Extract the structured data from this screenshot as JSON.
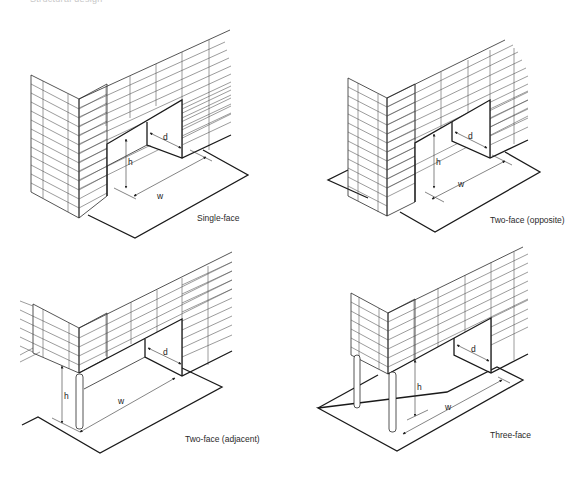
{
  "header": {
    "cut_off_text": "Structural design"
  },
  "panels": [
    {
      "id": "single-face",
      "caption": "Single-face",
      "dims": {
        "h": "h",
        "w": "w",
        "d": "d"
      }
    },
    {
      "id": "two-face-opposite",
      "caption": "Two-face (opposite)",
      "dims": {
        "h": "h",
        "w": "w",
        "d": "d"
      }
    },
    {
      "id": "two-face-adjacent",
      "caption": "Two-face (adjacent)",
      "dims": {
        "h": "h",
        "w": "w",
        "d": "d"
      }
    },
    {
      "id": "three-face",
      "caption": "Three-face",
      "dims": {
        "h": "h",
        "w": "w",
        "d": "d"
      }
    }
  ],
  "colors": {
    "line": "#2a2a2a",
    "background": "#ffffff"
  }
}
